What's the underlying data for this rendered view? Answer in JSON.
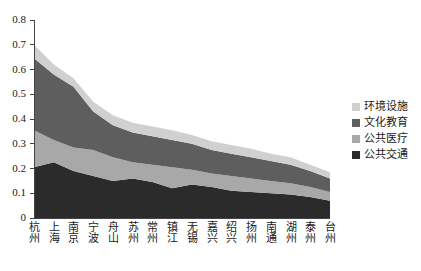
{
  "chart_data": {
    "type": "area",
    "title": "",
    "xlabel": "",
    "ylabel": "",
    "ylim": [
      0,
      0.8
    ],
    "yticks": [
      "0",
      "0.1",
      "0.2",
      "0.3",
      "0.4",
      "0.5",
      "0.6",
      "0.7",
      "0.8"
    ],
    "grid": false,
    "stacked": true,
    "legend_position": "right",
    "categories": [
      "杭州",
      "上海",
      "南京",
      "宁波",
      "舟山",
      "苏州",
      "常州",
      "镇江",
      "无锡",
      "嘉兴",
      "绍兴",
      "扬州",
      "南通",
      "湖州",
      "泰州",
      "台州"
    ],
    "series": [
      {
        "name": "公共交通",
        "color": "#2b2b2b",
        "values": [
          0.205,
          0.225,
          0.19,
          0.17,
          0.15,
          0.16,
          0.145,
          0.12,
          0.135,
          0.125,
          0.11,
          0.105,
          0.1,
          0.095,
          0.085,
          0.07
        ]
      },
      {
        "name": "公共医疗",
        "color": "#a8a8a8",
        "values": [
          0.15,
          0.09,
          0.095,
          0.105,
          0.095,
          0.065,
          0.07,
          0.085,
          0.06,
          0.055,
          0.06,
          0.055,
          0.05,
          0.045,
          0.04,
          0.035
        ]
      },
      {
        "name": "文化教育",
        "color": "#5e5e5e",
        "values": [
          0.29,
          0.265,
          0.245,
          0.155,
          0.13,
          0.12,
          0.115,
          0.11,
          0.105,
          0.095,
          0.09,
          0.085,
          0.08,
          0.075,
          0.065,
          0.055
        ]
      },
      {
        "name": "环境设施",
        "color": "#d0d0d0",
        "values": [
          0.055,
          0.04,
          0.035,
          0.04,
          0.04,
          0.04,
          0.04,
          0.04,
          0.035,
          0.035,
          0.035,
          0.035,
          0.03,
          0.03,
          0.025,
          0.025
        ]
      }
    ],
    "legend": [
      {
        "label": "环境设施",
        "color": "#d0d0d0"
      },
      {
        "label": "文化教育",
        "color": "#5e5e5e"
      },
      {
        "label": "公共医疗",
        "color": "#a8a8a8"
      },
      {
        "label": "公共交通",
        "color": "#2b2b2b"
      }
    ]
  },
  "axis": {
    "color": "#444444"
  }
}
